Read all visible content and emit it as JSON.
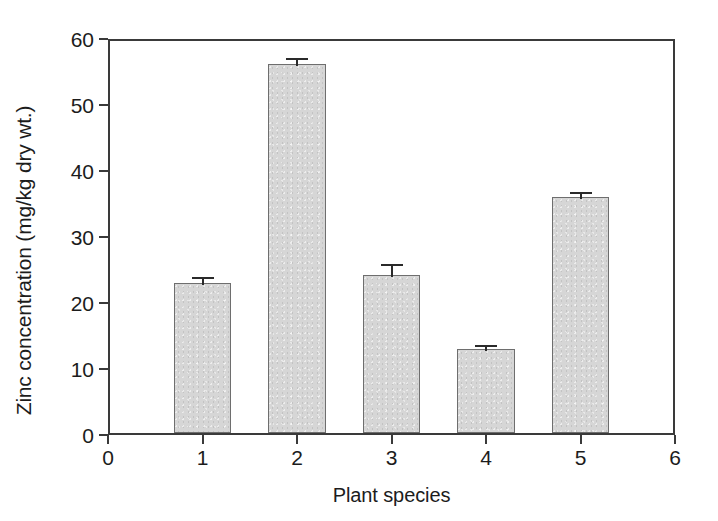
{
  "chart_data": {
    "type": "bar",
    "title": "",
    "xlabel": "Plant species",
    "ylabel": "Zinc concentration (mg/kg dry wt.)",
    "categories": [
      "1",
      "2",
      "3",
      "4",
      "5"
    ],
    "values": [
      22.8,
      55.9,
      24.0,
      12.7,
      35.7
    ],
    "errors": [
      1.2,
      1.2,
      1.9,
      1.0,
      1.1
    ],
    "xlim": [
      0,
      6
    ],
    "ylim": [
      0,
      60
    ],
    "xticks": [
      "0",
      "1",
      "2",
      "3",
      "4",
      "5",
      "6"
    ],
    "yticks": [
      "0",
      "10",
      "20",
      "30",
      "40",
      "50",
      "60"
    ],
    "bar_width": 0.61,
    "grid": false,
    "legend": null,
    "bar_fill_color": "#d6d6d6",
    "bar_edge_color": "#6e6e6e",
    "axis_color": "#3a3a3a",
    "error_bar_color": "#2a2a2a",
    "background_color": "#ffffff"
  }
}
